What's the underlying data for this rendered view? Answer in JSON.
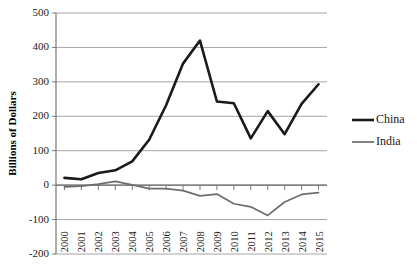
{
  "chart_data": {
    "type": "line",
    "title": "",
    "xlabel": "",
    "ylabel": "Billions of Dollars",
    "ylim": [
      -200,
      500
    ],
    "ytick_values": [
      500,
      400,
      300,
      200,
      100,
      0,
      -100,
      -200
    ],
    "ytick_labels": [
      "500",
      "400",
      "300",
      "200",
      "100",
      "0",
      "-100",
      "-200"
    ],
    "grid": true,
    "legend_position": "right",
    "categories": [
      "2000",
      "2001",
      "2002",
      "2003",
      "2004",
      "2005",
      "2006",
      "2007",
      "2008",
      "2009",
      "2010",
      "2011",
      "2012",
      "2013",
      "2014",
      "2015"
    ],
    "series": [
      {
        "name": "China",
        "color": "#1a1a1a",
        "width": 2.6,
        "values": [
          21,
          17,
          35,
          43,
          69,
          132,
          232,
          353,
          420,
          243,
          238,
          136,
          215,
          148,
          236,
          293
        ]
      },
      {
        "name": "India",
        "color": "#6d6d6d",
        "width": 1.7,
        "values": [
          -5,
          -3,
          3,
          11,
          1,
          -10,
          -10,
          -16,
          -31,
          -26,
          -54,
          -63,
          -88,
          -49,
          -27,
          -22
        ]
      }
    ]
  },
  "legend": {
    "entries": [
      {
        "label": "China"
      },
      {
        "label": "India"
      }
    ]
  },
  "axes": {
    "y_title": "Billions of Dollars"
  }
}
